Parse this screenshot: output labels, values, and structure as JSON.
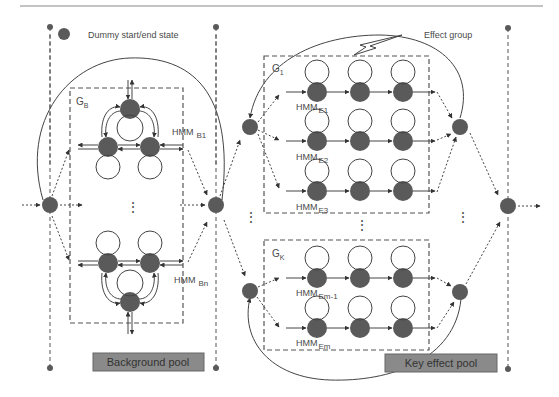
{
  "legend": {
    "dummy_state_label": "Dummy start/end state"
  },
  "colors": {
    "node": "#5a5a5a",
    "line": "#444444",
    "pool_fill": "#8a8a8a",
    "background": "#ffffff"
  },
  "background_section": {
    "group_label": "G",
    "group_sub": "B",
    "hmm_top": {
      "label": "HMM",
      "sub": "B1"
    },
    "hmm_bottom": {
      "label": "HMM",
      "sub": "Bn"
    },
    "ellipsis": "⋮",
    "pool_label": "Background pool"
  },
  "effect_section": {
    "callout_label": "Effect group",
    "group1": {
      "label": "G",
      "sub": "1",
      "rows": [
        {
          "label": "HMM",
          "sub": "E1"
        },
        {
          "label": "HMM",
          "sub": "E2"
        },
        {
          "label": "HMM",
          "sub": "E3"
        }
      ]
    },
    "groupK": {
      "label": "G",
      "sub": "K",
      "rows": [
        {
          "label": "HMM",
          "sub": "Em-1"
        },
        {
          "label": "HMM",
          "sub": "Em"
        }
      ]
    },
    "ellipsis": "⋮",
    "pool_label": "Key effect pool"
  }
}
